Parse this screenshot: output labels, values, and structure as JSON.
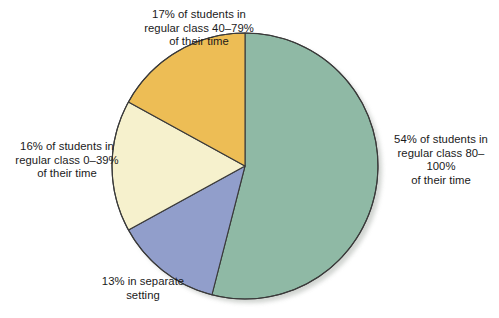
{
  "figure": {
    "background_color": "#ffffff",
    "border_color": "#3a3a3a",
    "shadow_color": "#c9cdc9"
  },
  "chart_data": {
    "type": "pie",
    "title": "",
    "subtitle": "",
    "xlabel": "",
    "ylabel": "",
    "legend_position": "none",
    "grid": false,
    "start_angle_deg": 0,
    "direction": "clockwise",
    "units": "percent",
    "center": {
      "cx": 245,
      "cy": 166,
      "r": 133
    },
    "categories": [
      "54% of students in regular class 80–100% of their time",
      "13% in separate setting",
      "16% of students in regular class 0–39% of their time",
      "17% of students in regular class 40–79% of their time"
    ],
    "values": [
      54,
      13,
      16,
      17
    ],
    "colors": [
      "#8fb9a5",
      "#919ecb",
      "#f6f1cd",
      "#edbd55"
    ],
    "slices": [
      {
        "key": "regular-class-80-100",
        "label": "54% of students in regular class 80–100% of their time",
        "value": 54,
        "percent_text": "54%",
        "color": "#8fb9a5",
        "start_deg": 0,
        "end_deg": 194.4
      },
      {
        "key": "separate-setting",
        "label": "13% in separate setting",
        "value": 13,
        "percent_text": "13%",
        "color": "#919ecb",
        "start_deg": 194.4,
        "end_deg": 241.2
      },
      {
        "key": "regular-class-0-39",
        "label": "16% of students in regular class 0–39% of their time",
        "value": 16,
        "percent_text": "16%",
        "color": "#f6f1cd",
        "start_deg": 241.2,
        "end_deg": 298.8
      },
      {
        "key": "regular-class-40-79",
        "label": "17% of students in regular class 40–79% of their time",
        "value": 17,
        "percent_text": "17%",
        "color": "#edbd55",
        "start_deg": 298.8,
        "end_deg": 360
      }
    ]
  },
  "labels": {
    "top": "17% of students in\nregular class 40–79%\nof their time",
    "left": "16% of students in\nregular class 0–39%\nof their time",
    "right": "54% of students in\nregular class 80–100%\nof their time",
    "bottom": "13% in separate\nsetting"
  }
}
